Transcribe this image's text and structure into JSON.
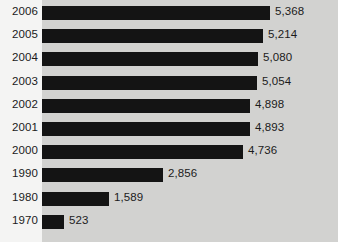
{
  "chart_data": {
    "type": "bar",
    "orientation": "horizontal",
    "title": "",
    "subtitle": "",
    "xlabel": "",
    "ylabel": "",
    "grid": false,
    "legend": null,
    "xlim": [
      0,
      5368
    ],
    "categories": [
      "2006",
      "2005",
      "2004",
      "2003",
      "2002",
      "2001",
      "2000",
      "1990",
      "1980",
      "1970"
    ],
    "values": [
      5368,
      5214,
      5080,
      5054,
      4898,
      4893,
      4736,
      2856,
      1589,
      523
    ],
    "value_labels": [
      "5,368",
      "5,214",
      "5,080",
      "5,054",
      "4,898",
      "4,893",
      "4,736",
      "2,856",
      "1,589",
      "523"
    ],
    "bars": [
      {
        "category": "2006",
        "value": 5368,
        "value_label": "5,368"
      },
      {
        "category": "2005",
        "value": 5214,
        "value_label": "5,214"
      },
      {
        "category": "2004",
        "value": 5080,
        "value_label": "5,080"
      },
      {
        "category": "2003",
        "value": 5054,
        "value_label": "5,054"
      },
      {
        "category": "2002",
        "value": 4898,
        "value_label": "4,898"
      },
      {
        "category": "2001",
        "value": 4893,
        "value_label": "4,893"
      },
      {
        "category": "2000",
        "value": 4736,
        "value_label": "4,736"
      },
      {
        "category": "1990",
        "value": 2856,
        "value_label": "2,856"
      },
      {
        "category": "1980",
        "value": 1589,
        "value_label": "1,589"
      },
      {
        "category": "1970",
        "value": 523,
        "value_label": "523"
      }
    ]
  },
  "colors": {
    "bar": "#141414",
    "plot_background": "#d2d2d0",
    "page_background": "#f4f4f3",
    "text": "#1b1b1b"
  }
}
